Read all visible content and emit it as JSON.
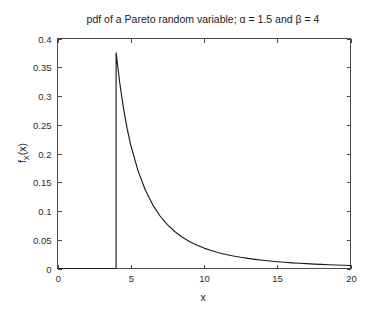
{
  "chart_data": {
    "type": "line",
    "title": "pdf of a Pareto random variable; α = 1.5 and β = 4",
    "xlabel": "x",
    "ylabel": "f_X(x)",
    "ylabel_parts": {
      "base": "f",
      "sub": "X",
      "arg": "(x)"
    },
    "xlim": [
      0,
      20
    ],
    "ylim": [
      0,
      0.4
    ],
    "grid": false,
    "legend": null,
    "xticks": [
      0,
      5,
      10,
      15,
      20
    ],
    "xtick_labels": [
      "0",
      "5",
      "10",
      "15",
      "20"
    ],
    "yticks": [
      0,
      0.05,
      0.1,
      0.15,
      0.2,
      0.25,
      0.3,
      0.35,
      0.4
    ],
    "ytick_labels": [
      "0",
      "0.05",
      "0.1",
      "0.15",
      "0.2",
      "0.25",
      "0.3",
      "0.35",
      "0.4"
    ],
    "parameters": {
      "alpha": 1.5,
      "beta": 4
    },
    "series": [
      {
        "name": "Pareto pdf",
        "color": "#1a1a1a",
        "x": [
          0,
          1,
          2,
          3,
          3.999,
          4,
          4.25,
          4.5,
          4.75,
          5,
          5.5,
          6,
          6.5,
          7,
          7.5,
          8,
          8.5,
          9,
          9.5,
          10,
          10.5,
          11,
          11.5,
          12,
          12.5,
          13,
          13.5,
          14,
          14.5,
          15,
          15.5,
          16,
          16.5,
          17,
          17.5,
          18,
          18.5,
          19,
          19.5,
          20
        ],
        "y": [
          0,
          0,
          0,
          0,
          0,
          0.375,
          0.3226,
          0.2794,
          0.2436,
          0.2147,
          0.1698,
          0.1361,
          0.1107,
          0.0913,
          0.0762,
          0.0643,
          0.0548,
          0.0471,
          0.0408,
          0.0355,
          0.0312,
          0.0275,
          0.0244,
          0.0218,
          0.0195,
          0.0175,
          0.0158,
          0.0143,
          0.013,
          0.0118,
          0.0108,
          0.0099,
          0.0091,
          0.0084,
          0.0077,
          0.0071,
          0.0066,
          0.0061,
          0.0057,
          0.0053
        ]
      }
    ],
    "annotations": [
      {
        "name": "jump-discontinuity",
        "x": 4,
        "y_from": 0,
        "y_to": 0.375
      }
    ]
  }
}
